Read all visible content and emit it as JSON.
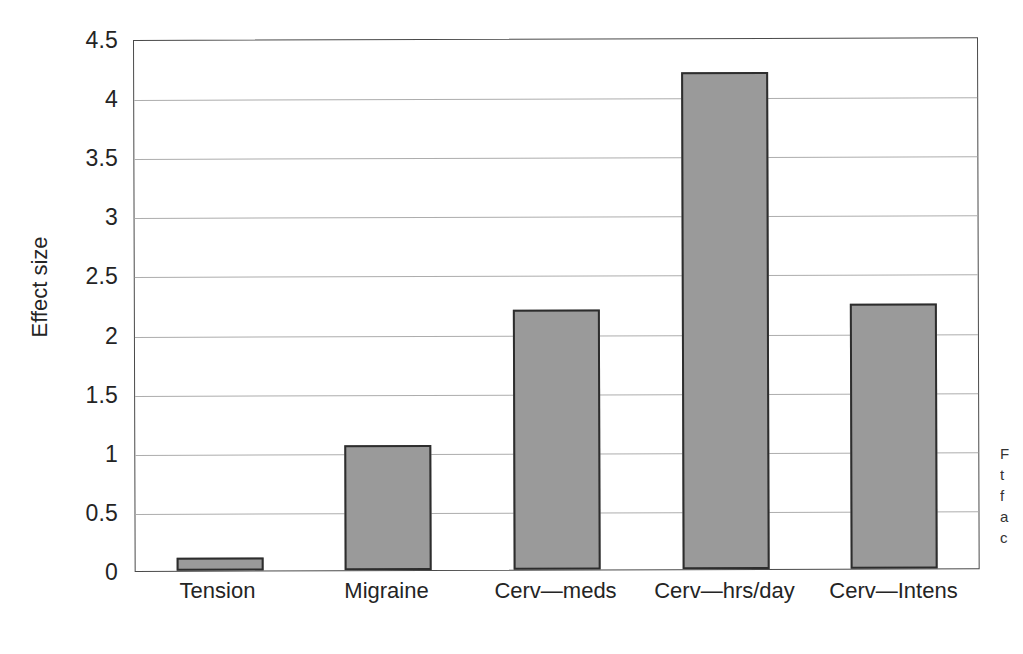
{
  "chart_data": {
    "type": "bar",
    "title": "",
    "xlabel": "",
    "ylabel": "Effect size",
    "categories": [
      "Tension",
      "Migraine",
      "Cerv—meds",
      "Cerv—hrs/day",
      "Cerv—Intens"
    ],
    "values": [
      0.11,
      1.06,
      2.2,
      4.2,
      2.24
    ],
    "ylim": [
      0,
      4.5
    ],
    "ytick_labels": [
      "0",
      "0.5",
      "1",
      "1.5",
      "2",
      "2.5",
      "3",
      "3.5",
      "4",
      "4.5"
    ],
    "ytick_values": [
      0,
      0.5,
      1,
      1.5,
      2,
      2.5,
      3,
      3.5,
      4,
      4.5
    ],
    "grid": true,
    "legend": false,
    "bar_color": "#9a9a9a",
    "bar_edge_color": "#2d2d2d",
    "gridline_color": "#adadad",
    "axis_color": "#4a4a4a",
    "background_color": "#ffffff"
  },
  "margin_caption": {
    "lines": [
      "F",
      "t",
      "f",
      "a",
      "c",
      "i"
    ]
  }
}
